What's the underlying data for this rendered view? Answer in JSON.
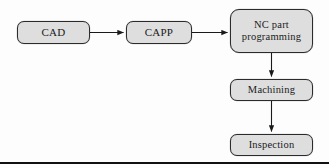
{
  "diagram": {
    "background_color": "#fdfdfd",
    "node_fill_color": "#dedede",
    "node_border_color": "#2b2b2b",
    "text_color": "#1a1a1a",
    "arrow_color": "#1a1a1a",
    "rule_color": "#111111",
    "nodes": [
      {
        "id": "cad",
        "label": "CAD"
      },
      {
        "id": "capp",
        "label": "CAPP"
      },
      {
        "id": "nc",
        "label_line1": "NC part",
        "label_line2": "programming"
      },
      {
        "id": "machining",
        "label": "Machining"
      },
      {
        "id": "inspection",
        "label": "Inspection"
      }
    ],
    "edges": [
      {
        "id": "cad-to-capp",
        "from": "CAD",
        "to": "CAPP",
        "direction": "right"
      },
      {
        "id": "capp-to-nc",
        "from": "CAPP",
        "to": "NC part programming",
        "direction": "right"
      },
      {
        "id": "nc-to-machining",
        "from": "NC part programming",
        "to": "Machining",
        "direction": "down"
      },
      {
        "id": "machining-to-inspection",
        "from": "Machining",
        "to": "Inspection",
        "direction": "down"
      }
    ]
  }
}
